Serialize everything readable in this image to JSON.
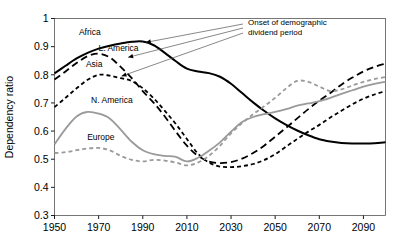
{
  "chart_data": {
    "type": "line",
    "title": "",
    "xlabel": "",
    "ylabel": "Dependency ratio",
    "xlim": [
      1950,
      2100
    ],
    "ylim": [
      0.3,
      1.0
    ],
    "grid": false,
    "legend_position": "inline-labels",
    "xticks": [
      "1950",
      "1970",
      "1990",
      "2010",
      "2030",
      "2050",
      "2070",
      "2090"
    ],
    "xtick_values": [
      1950,
      1970,
      1990,
      2010,
      2030,
      2050,
      2070,
      2090
    ],
    "yticks": [
      "0.3",
      "0.4",
      "0.5",
      "0.6",
      "0.7",
      "0.8",
      "0.9",
      "1"
    ],
    "ytick_values": [
      0.3,
      0.4,
      0.5,
      0.6,
      0.7,
      0.8,
      0.9,
      1.0
    ],
    "x": [
      1950,
      1955,
      1960,
      1965,
      1970,
      1975,
      1980,
      1985,
      1990,
      1995,
      2000,
      2005,
      2010,
      2015,
      2020,
      2025,
      2030,
      2035,
      2040,
      2045,
      2050,
      2055,
      2060,
      2065,
      2070,
      2075,
      2080,
      2085,
      2090,
      2095,
      2100
    ],
    "series": [
      {
        "name": "Africa",
        "style": "solid",
        "color": "#000000",
        "width": 2.0,
        "values": [
          0.805,
          0.832,
          0.858,
          0.878,
          0.893,
          0.903,
          0.911,
          0.917,
          0.918,
          0.905,
          0.878,
          0.848,
          0.822,
          0.812,
          0.806,
          0.793,
          0.768,
          0.735,
          0.702,
          0.672,
          0.645,
          0.622,
          0.602,
          0.585,
          0.571,
          0.563,
          0.558,
          0.556,
          0.556,
          0.557,
          0.56
        ]
      },
      {
        "name": "L. America",
        "style": "dashed-long",
        "color": "#000000",
        "width": 1.8,
        "values": [
          0.783,
          0.812,
          0.842,
          0.866,
          0.875,
          0.862,
          0.828,
          0.788,
          0.742,
          0.7,
          0.652,
          0.598,
          0.548,
          0.512,
          0.492,
          0.486,
          0.49,
          0.502,
          0.522,
          0.548,
          0.58,
          0.612,
          0.645,
          0.678,
          0.708,
          0.735,
          0.765,
          0.79,
          0.812,
          0.828,
          0.84
        ]
      },
      {
        "name": "Asia",
        "style": "dashed-short",
        "color": "#000000",
        "width": 1.8,
        "values": [
          0.685,
          0.718,
          0.752,
          0.782,
          0.8,
          0.797,
          0.788,
          0.778,
          0.752,
          0.716,
          0.672,
          0.625,
          0.572,
          0.52,
          0.488,
          0.474,
          0.472,
          0.475,
          0.483,
          0.497,
          0.518,
          0.545,
          0.572,
          0.598,
          0.622,
          0.648,
          0.672,
          0.695,
          0.715,
          0.73,
          0.742
        ]
      },
      {
        "name": "N. America",
        "style": "solid",
        "color": "#9a9a9a",
        "width": 1.8,
        "values": [
          0.553,
          0.608,
          0.652,
          0.668,
          0.662,
          0.645,
          0.605,
          0.562,
          0.532,
          0.518,
          0.512,
          0.508,
          0.492,
          0.505,
          0.53,
          0.56,
          0.598,
          0.632,
          0.65,
          0.66,
          0.668,
          0.678,
          0.69,
          0.698,
          0.706,
          0.718,
          0.732,
          0.745,
          0.758,
          0.768,
          0.775
        ]
      },
      {
        "name": "Europe",
        "style": "dashed-short",
        "color": "#9a9a9a",
        "width": 1.8,
        "values": [
          0.522,
          0.525,
          0.532,
          0.538,
          0.54,
          0.532,
          0.512,
          0.498,
          0.492,
          0.498,
          0.495,
          0.488,
          0.478,
          0.488,
          0.512,
          0.548,
          0.592,
          0.628,
          0.66,
          0.688,
          0.718,
          0.752,
          0.778,
          0.775,
          0.758,
          0.742,
          0.748,
          0.762,
          0.775,
          0.785,
          0.792
        ]
      }
    ],
    "series_labels": [
      {
        "text": "Africa",
        "x": 1966,
        "y": 0.942
      },
      {
        "text": "L. America",
        "x": 1979,
        "y": 0.885
      },
      {
        "text": "Asia",
        "x": 1968,
        "y": 0.828
      },
      {
        "text": "N. America",
        "x": 1976,
        "y": 0.7
      },
      {
        "text": "Europe",
        "x": 1971,
        "y": 0.567
      }
    ],
    "annotations": [
      {
        "text_line1": "Onset of demographic",
        "text_line2": "dividend period",
        "text_x": 2030,
        "text_y": 0.978,
        "arrows": [
          {
            "to_x": 1990,
            "to_y": 0.915
          },
          {
            "to_x": 1982,
            "to_y": 0.862
          },
          {
            "to_x": 1979,
            "to_y": 0.795
          }
        ]
      }
    ]
  },
  "annotation": {
    "line1": "Onset of demographic",
    "line2": "dividend period"
  },
  "axes": {
    "y_title": "Dependency ratio"
  }
}
